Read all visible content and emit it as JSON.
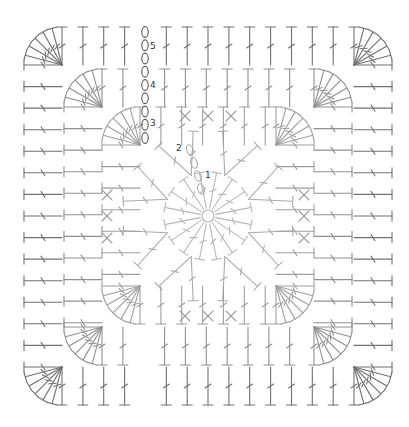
{
  "diagram": {
    "type": "crochet-chart",
    "center": [
      208,
      216
    ],
    "ring_radius": 6,
    "round_labels": [
      {
        "text": "1",
        "x": 205,
        "y": 171
      },
      {
        "text": "2",
        "x": 176,
        "y": 144
      },
      {
        "text": "3",
        "x": 150,
        "y": 119
      },
      {
        "text": "4",
        "x": 150,
        "y": 81
      },
      {
        "text": "5",
        "x": 150,
        "y": 42
      }
    ],
    "rounds": [
      {
        "round": 1,
        "color": "#b8b8b8",
        "stitch": "dc",
        "count": 16
      },
      {
        "round": 2,
        "color": "#aaaaaa",
        "stitch": "dc-v",
        "count": 16
      },
      {
        "round": 3,
        "color": "#9e9e9e",
        "corner": [
          140,
          145,
          276,
          286
        ],
        "stitch": "dc+sc"
      },
      {
        "round": 4,
        "color": "#8f8f8f",
        "corner": [
          102,
          107,
          314,
          327
        ],
        "stitch": "dc"
      },
      {
        "round": 5,
        "color": "#707070",
        "corner": [
          62,
          65,
          354,
          367
        ],
        "stitch": "dc"
      }
    ],
    "chain": {
      "x": 145,
      "y_start": 32,
      "y_end": 138,
      "count": 9,
      "color": "#555555"
    },
    "legend": {
      "ring": "magic ring",
      "oval": "chain",
      "x": "single crochet",
      "t_tick": "double crochet"
    }
  }
}
